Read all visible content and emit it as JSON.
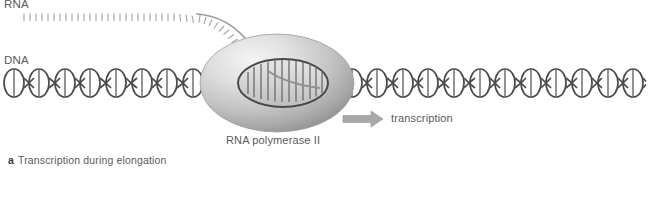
{
  "figure": {
    "background_color": "#ffffff",
    "labels": {
      "rna": "RNA",
      "dna": "DNA",
      "polymerase": "RNA polymerase II",
      "transcription": "transcription"
    },
    "caption": {
      "panel_letter": "a",
      "text": "Transcription during elongation"
    },
    "colors": {
      "stroke": "#4a4a4a",
      "rna_strand": "#9a9a9a",
      "arrow_fill": "#a8a8a8",
      "text": "#5a5a5a",
      "enzyme_light": "#f0f0f0",
      "enzyme_mid": "#c9c9c9",
      "enzyme_dark": "#8e8e8e",
      "bubble_fill": "#d8d8d8"
    },
    "diagram": {
      "type": "molecular-biology-schematic",
      "subject": "RNA polymerase II transcribing a DNA double helix during the elongation phase",
      "dna_axis_y": 83,
      "dna_start_x": 4,
      "dna_end_x": 646,
      "helix_repeat_px": 25.7,
      "helix_turn_width": 20,
      "helix_turn_height": 28,
      "polymerase": {
        "center_x": 277,
        "center_y": 83,
        "radius_x": 77,
        "radius_y": 49
      },
      "transcription_bubble": {
        "center_x": 283,
        "center_y": 83,
        "radius_x": 45,
        "radius_y": 24,
        "base_rungs": 13
      },
      "rna_transcript": {
        "horizontal_start_x": 18,
        "horizontal_y": 14,
        "tick_count": 30,
        "tick_length": 7,
        "exits_into_polymerase": true
      },
      "direction_arrow": {
        "x": 343,
        "y": 119,
        "length": 40,
        "points": "right"
      }
    }
  }
}
